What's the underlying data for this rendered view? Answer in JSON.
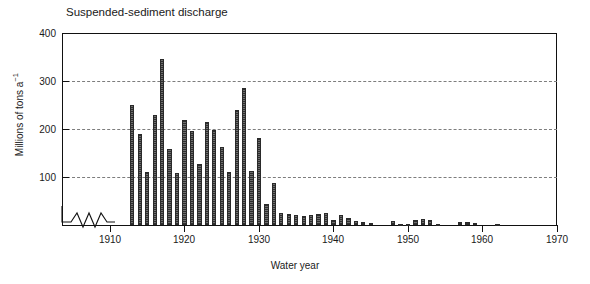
{
  "chart": {
    "title": "Suspended-sediment discharge",
    "xlabel": "Water year",
    "ylabel_main": "Millions of tons a",
    "ylabel_exp": "−1"
  },
  "axes": {
    "y_ticks": [
      "400",
      "300",
      "200",
      "100"
    ],
    "x_ticks": [
      "1910",
      "1920",
      "1930",
      "1940",
      "1950",
      "1960",
      "1970"
    ]
  },
  "chart_data": {
    "type": "bar",
    "title": "Suspended-sediment discharge",
    "xlabel": "Water year",
    "ylabel": "Millions of tons a-1",
    "xlim": [
      1906,
      1970
    ],
    "ylim": [
      0,
      400
    ],
    "ytick_values": [
      0,
      100,
      200,
      300,
      400
    ],
    "xtick_values": [
      1910,
      1920,
      1930,
      1940,
      1950,
      1960,
      1970
    ],
    "gridlines": {
      "y_dashed": [
        100,
        200,
        300
      ],
      "x": false
    },
    "axis_break": {
      "axis": "x",
      "between": [
        1906.5,
        1912.0
      ],
      "style": "zigzag"
    },
    "legend": null,
    "bar_color": "#4a4a4a",
    "categories": [
      1913,
      1914,
      1915,
      1916,
      1917,
      1918,
      1919,
      1920,
      1921,
      1922,
      1923,
      1924,
      1925,
      1926,
      1927,
      1928,
      1929,
      1930,
      1931,
      1932,
      1933,
      1934,
      1935,
      1936,
      1937,
      1938,
      1939,
      1940,
      1941,
      1942,
      1943,
      1944,
      1945,
      1946,
      1947,
      1948,
      1949,
      1950,
      1951,
      1952,
      1953,
      1954,
      1955,
      1956,
      1957,
      1958,
      1959,
      1960,
      1961,
      1962
    ],
    "values": [
      250,
      190,
      110,
      230,
      345,
      158,
      108,
      218,
      195,
      127,
      215,
      198,
      162,
      110,
      240,
      285,
      112,
      182,
      43,
      88,
      25,
      22,
      21,
      18,
      20,
      22,
      25,
      10,
      20,
      14,
      9,
      7,
      5,
      0,
      0,
      8,
      3,
      2,
      11,
      13,
      10,
      2,
      0,
      0,
      6,
      6,
      5,
      0,
      0,
      3
    ]
  }
}
